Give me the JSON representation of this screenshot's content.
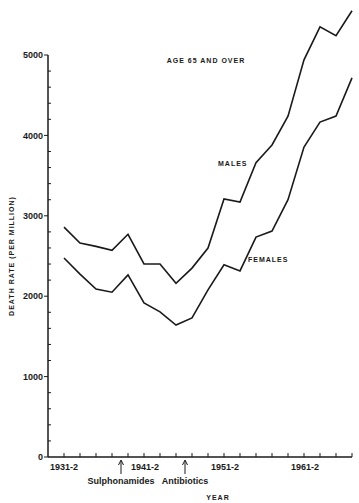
{
  "chart_data": {
    "type": "line",
    "title": "AGE 65 AND OVER",
    "xlabel": "YEAR",
    "ylabel": "DEATH RATE (PER MILLION)",
    "ylim": [
      0,
      5000
    ],
    "yticks": [
      0,
      1000,
      2000,
      3000,
      4000,
      5000
    ],
    "ytick_labels": [
      "0",
      "1000",
      "2000",
      "3000",
      "4000",
      "5000"
    ],
    "xtick_labels": [
      "1931-2",
      "1941-2",
      "1951-2",
      "1961-2"
    ],
    "x": [
      "1931-2",
      "1933-4",
      "1935-6",
      "1937-8",
      "1939-40",
      "1941-2",
      "1943-4",
      "1945-6",
      "1947-8",
      "1949-50",
      "1951-2",
      "1953-4",
      "1955-6",
      "1957-8",
      "1959-60",
      "1961-2",
      "1963-4",
      "1965-6",
      "1967-8"
    ],
    "series": [
      {
        "name": "MALES",
        "values": [
          2860,
          2660,
          2620,
          2570,
          2770,
          2400,
          2400,
          2160,
          2350,
          2600,
          3210,
          3170,
          3660,
          3880,
          4240,
          4940,
          5350,
          5240,
          5550
        ]
      },
      {
        "name": "FEMALES",
        "values": [
          2475,
          2275,
          2090,
          2050,
          2265,
          1915,
          1805,
          1640,
          1730,
          2080,
          2390,
          2315,
          2735,
          2810,
          3200,
          3855,
          4165,
          4240,
          4715
        ]
      }
    ],
    "annotations": [
      {
        "text": "Sulphonamides",
        "x": "1938-9"
      },
      {
        "text": "Antibiotics",
        "x": "1946-7"
      }
    ],
    "grid": false,
    "legend": "inline labels"
  },
  "labels": {
    "title": "AGE 65 AND OVER",
    "males": "MALES",
    "females": "FEMALES",
    "xlabel": "YEAR",
    "ylabel": "DEATH RATE (PER MILLION)",
    "sulphonamides": "Sulphonamides",
    "antibiotics": "Antibiotics",
    "y0": "0",
    "y1000": "1000",
    "y2000": "2000",
    "y3000": "3000",
    "y4000": "4000",
    "y5000": "5000",
    "x1931": "1931-2",
    "x1941": "1941-2",
    "x1951": "1951-2",
    "x1961": "1961-2"
  },
  "colors": {
    "line": "#1a1a1a",
    "background": "#ffffff"
  }
}
